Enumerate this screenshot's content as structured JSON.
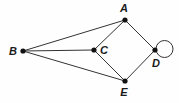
{
  "diagram": {
    "type": "graph-diagram",
    "canvas": {
      "width": 179,
      "height": 103
    },
    "colors": {
      "background": "#fefefe",
      "edge": "#333333",
      "vertex": "#111111",
      "label": "#1a1a1a",
      "loop": "#333333"
    },
    "style": {
      "edge_width": 1,
      "vertex_radius": 2.6,
      "loop_radius": 8.5,
      "label_font_size": 11,
      "label_italic": true,
      "label_bold": true
    },
    "vertices": [
      {
        "id": "A",
        "label": "A",
        "x": 125,
        "y": 20,
        "label_x": 124,
        "label_y": 12,
        "label_anchor": "middle"
      },
      {
        "id": "B",
        "label": "B",
        "x": 23,
        "y": 51,
        "label_x": 13,
        "label_y": 55,
        "label_anchor": "middle"
      },
      {
        "id": "C",
        "label": "C",
        "x": 94,
        "y": 50,
        "label_x": 104,
        "label_y": 54,
        "label_anchor": "middle"
      },
      {
        "id": "D",
        "label": "D",
        "x": 155,
        "y": 50,
        "label_x": 156,
        "label_y": 67,
        "label_anchor": "middle"
      },
      {
        "id": "E",
        "label": "E",
        "x": 125,
        "y": 81,
        "label_x": 124,
        "label_y": 96,
        "label_anchor": "middle"
      }
    ],
    "edges": [
      {
        "id": "B-A",
        "from": "B",
        "to": "A"
      },
      {
        "id": "B-C",
        "from": "B",
        "to": "C"
      },
      {
        "id": "B-E",
        "from": "B",
        "to": "E"
      },
      {
        "id": "A-C",
        "from": "A",
        "to": "C"
      },
      {
        "id": "C-E",
        "from": "C",
        "to": "E"
      },
      {
        "id": "A-D",
        "from": "A",
        "to": "D"
      },
      {
        "id": "D-E",
        "from": "D",
        "to": "E"
      }
    ],
    "loops": [
      {
        "id": "D-loop",
        "at": "D",
        "cx": 164.5,
        "cy": 49,
        "r": 8.5
      }
    ]
  }
}
